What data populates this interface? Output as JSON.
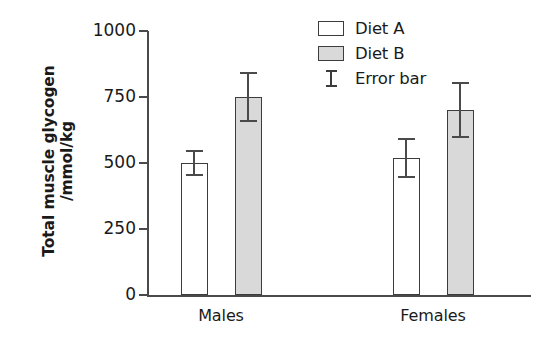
{
  "chart_data": {
    "type": "bar",
    "title": "",
    "xlabel": "",
    "ylabel": "Total muscle glycogen /mmol/kg",
    "ylabel_line1": "Total muscle glycogen",
    "ylabel_line2": "/mmol/kg",
    "categories": [
      "Males",
      "Females"
    ],
    "ylim": [
      0,
      1000
    ],
    "yticks": [
      0,
      250,
      500,
      750,
      1000
    ],
    "ytick_labels": [
      "0",
      "250",
      "500",
      "750",
      "1000"
    ],
    "grid": false,
    "legend_position": "top-right",
    "series": [
      {
        "name": "Diet A",
        "color": "#ffffff",
        "values": [
          500,
          520
        ],
        "errors": [
          48,
          75
        ]
      },
      {
        "name": "Diet B",
        "color": "#d9d9d9",
        "values": [
          750,
          700
        ],
        "errors": [
          95,
          105
        ]
      }
    ],
    "legend_entries": [
      {
        "label": "Diet A",
        "kind": "swatch",
        "color": "#ffffff"
      },
      {
        "label": "Diet B",
        "kind": "swatch",
        "color": "#d9d9d9"
      },
      {
        "label": "Error bar",
        "kind": "errorbar",
        "color": "#3c3c3c"
      }
    ],
    "colors": {
      "diet_a_fill": "#ffffff",
      "diet_b_fill": "#d9d9d9",
      "outline": "#3c3c3c",
      "axis": "#4a4a4a",
      "text": "#1a1a1a",
      "background": "#ffffff"
    }
  }
}
